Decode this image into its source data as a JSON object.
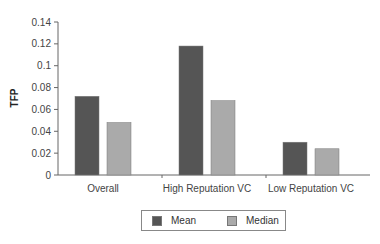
{
  "chart_data": {
    "type": "bar",
    "title": "",
    "xlabel": "",
    "ylabel": "TFP",
    "ylim": [
      0,
      0.14
    ],
    "yticks": [
      "0",
      "0.02",
      "0.04",
      "0.06",
      "0.08",
      "0.1",
      "0.12",
      "0.14"
    ],
    "ytick_values": [
      0,
      0.02,
      0.04,
      0.06,
      0.08,
      0.1,
      0.12,
      0.14
    ],
    "categories": [
      "Overall",
      "High Reputation VC",
      "Low Reputation VC"
    ],
    "series": [
      {
        "name": "Mean",
        "color": "#555555",
        "values": [
          0.072,
          0.118,
          0.03
        ]
      },
      {
        "name": "Median",
        "color": "#aaaaaa",
        "values": [
          0.048,
          0.068,
          0.024
        ]
      }
    ],
    "grid": false,
    "legend_position": "bottom"
  }
}
